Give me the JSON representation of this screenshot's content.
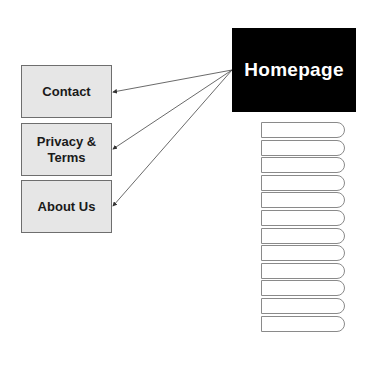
{
  "homepage": {
    "label": "Homepage",
    "color": "#000000"
  },
  "pages": [
    {
      "label": "Contact"
    },
    {
      "label": "Privacy & Terms"
    },
    {
      "label": "About Us"
    }
  ],
  "page_stack": {
    "count": 12
  },
  "arrows": [
    {
      "from": "Homepage",
      "to": "Contact"
    },
    {
      "from": "Homepage",
      "to": "Privacy & Terms"
    },
    {
      "from": "Homepage",
      "to": "About Us"
    }
  ]
}
